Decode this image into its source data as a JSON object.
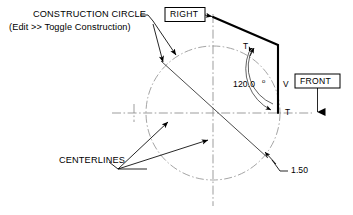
{
  "drawing": {
    "title": "Construction circle and centerlines CAD annotation diagram",
    "background_color": "#ffffff",
    "line_color": "#000000",
    "centerline_color": "#8d8d8d",
    "width": 353,
    "height": 215
  },
  "annotations": {
    "construction_circle_line1": "CONSTRUCTION CIRCLE",
    "construction_circle_line2": "(Edit >> Toggle Construction)",
    "centerlines_label": "CENTERLINES"
  },
  "view_labels": {
    "right": "RIGHT",
    "front": "FRONT"
  },
  "dimensions": {
    "angle": "120.0",
    "angle_degree_symbol": "o",
    "radius": "1.50"
  },
  "markers": {
    "tangent_upper": "T",
    "vertical": "V",
    "tangent_lower": "T"
  },
  "geometry": {
    "circle_center_x": 213,
    "circle_center_y": 113,
    "circle_radius": 67,
    "profile_vertex_top_x": 213,
    "profile_vertex_top_y": 17,
    "profile_vertex_mid_x": 278,
    "profile_vertex_mid_y": 45,
    "profile_vertex_bottom_x": 278,
    "profile_vertex_bottom_y": 113
  }
}
